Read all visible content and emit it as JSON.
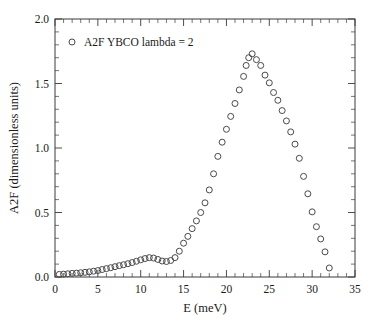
{
  "figure": {
    "background_color": "#ffffff",
    "axis_color": "#3a3a3a",
    "marker_color": "#4a4a4a"
  },
  "chart_data": {
    "type": "scatter",
    "title": "",
    "xlabel": "E (meV)",
    "ylabel": "A2F (dimensionless units)",
    "xlim": [
      0,
      35
    ],
    "ylim": [
      0,
      2.0
    ],
    "xticks": [
      0,
      5,
      10,
      15,
      20,
      25,
      30,
      35
    ],
    "xticklabels": [
      "0",
      "5",
      "10",
      "15",
      "20",
      "25",
      "30",
      "35"
    ],
    "yticks": [
      0.0,
      0.5,
      1.0,
      1.5,
      2.0
    ],
    "yticklabels": [
      "0.0",
      "0.5",
      "1.0",
      "1.5",
      "2.0"
    ],
    "x_minor_tick_step": 1,
    "y_minor_tick_step": 0.1,
    "grid": false,
    "tick_direction": "in",
    "legend_position": "upper left",
    "series": [
      {
        "name": "A2F YBCO lambda = 2",
        "marker": "open-circle",
        "marker_size": 3.0,
        "x": [
          0.5,
          1.0,
          1.5,
          2.0,
          2.5,
          3.0,
          3.5,
          4.0,
          4.5,
          5.0,
          5.5,
          6.0,
          6.5,
          7.0,
          7.5,
          8.0,
          8.5,
          9.0,
          9.5,
          10.0,
          10.5,
          11.0,
          11.5,
          12.0,
          12.5,
          13.0,
          13.5,
          14.0,
          14.5,
          15.0,
          15.5,
          16.0,
          16.5,
          17.0,
          17.5,
          18.0,
          18.5,
          19.0,
          19.5,
          20.0,
          20.5,
          21.0,
          21.5,
          22.0,
          22.3,
          22.6,
          23.0,
          23.5,
          24.0,
          24.5,
          25.0,
          25.5,
          26.0,
          26.5,
          27.0,
          27.5,
          28.0,
          28.5,
          29.0,
          29.5,
          30.0,
          30.5,
          31.0,
          31.5,
          32.0
        ],
        "y": [
          0.02,
          0.022,
          0.025,
          0.028,
          0.03,
          0.033,
          0.036,
          0.04,
          0.045,
          0.05,
          0.058,
          0.065,
          0.072,
          0.08,
          0.088,
          0.095,
          0.103,
          0.112,
          0.122,
          0.133,
          0.143,
          0.15,
          0.147,
          0.136,
          0.124,
          0.12,
          0.128,
          0.15,
          0.2,
          0.262,
          0.315,
          0.375,
          0.435,
          0.5,
          0.575,
          0.675,
          0.8,
          0.935,
          1.045,
          1.145,
          1.245,
          1.345,
          1.45,
          1.555,
          1.64,
          1.7,
          1.73,
          1.685,
          1.64,
          1.565,
          1.505,
          1.43,
          1.37,
          1.29,
          1.21,
          1.125,
          1.03,
          0.92,
          0.78,
          0.645,
          0.505,
          0.39,
          0.295,
          0.195,
          0.07
        ]
      }
    ]
  }
}
